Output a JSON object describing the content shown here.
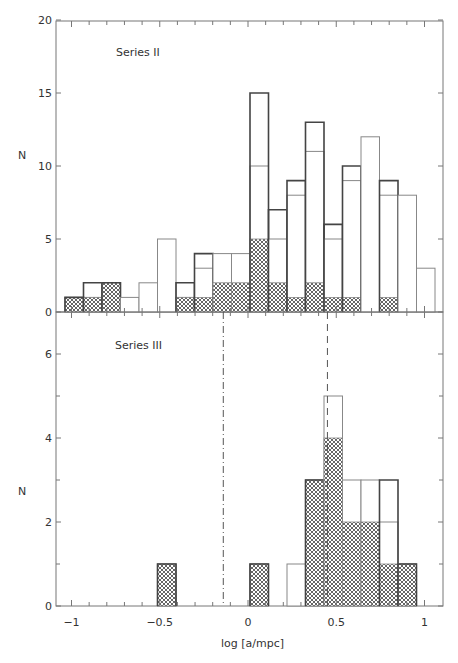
{
  "chart_data": [
    {
      "type": "bar",
      "title": "",
      "panel_label": "Series II",
      "xlabel": "",
      "ylabel": "N",
      "ylim": [
        0,
        20
      ],
      "yticks": [
        0,
        5,
        10,
        15,
        20
      ],
      "bin_width": 0.105,
      "bins_x_center": [
        -1.0,
        -0.9,
        -0.79,
        -0.69,
        -0.58,
        -0.48,
        -0.37,
        -0.27,
        -0.16,
        -0.06,
        0.06,
        0.16,
        0.27,
        0.37,
        0.48,
        0.58,
        0.69,
        0.79,
        0.9,
        1.0
      ],
      "series": [
        {
          "name": "total (outer outline)",
          "values": [
            1,
            2,
            2,
            1,
            2,
            5,
            2,
            4,
            4,
            4,
            15,
            7,
            9,
            13,
            6,
            10,
            12,
            9,
            8,
            3
          ]
        },
        {
          "name": "subset (inner line)",
          "values": [
            1,
            1,
            2,
            1,
            2,
            5,
            1,
            3,
            4,
            4,
            10,
            5,
            8,
            11,
            5,
            9,
            12,
            8,
            8,
            3
          ]
        },
        {
          "name": "hatched",
          "values": [
            1,
            1,
            2,
            0,
            0,
            0,
            1,
            1,
            2,
            2,
            5,
            2,
            1,
            2,
            1,
            1,
            0,
            1,
            0,
            0
          ]
        }
      ],
      "grid": false
    },
    {
      "type": "bar",
      "title": "",
      "panel_label": "Series III",
      "xlabel": "log [a/mpc]",
      "ylabel": "N",
      "ylim": [
        0,
        7
      ],
      "yticks": [
        0,
        2,
        4,
        6
      ],
      "xlim": [
        -1.05,
        1.1
      ],
      "xticks": [
        -1,
        -0.5,
        0,
        0.5,
        1
      ],
      "xtick_labels": [
        "−1",
        "−0.5",
        "0",
        "0.5",
        "1"
      ],
      "bin_width": 0.105,
      "bins_x_center": [
        -0.48,
        0.06,
        0.27,
        0.37,
        0.48,
        0.58,
        0.69,
        0.79,
        0.9
      ],
      "series": [
        {
          "name": "total (outer outline)",
          "values": [
            1,
            1,
            1,
            3,
            5,
            3,
            3,
            3,
            1
          ]
        },
        {
          "name": "subset (inner line)",
          "values": [
            1,
            1,
            1,
            3,
            5,
            3,
            3,
            2,
            1
          ]
        },
        {
          "name": "hatched",
          "values": [
            1,
            1,
            0,
            3,
            4,
            2,
            2,
            1,
            1
          ]
        }
      ],
      "vertical_lines": [
        {
          "x": -0.14,
          "style": "dash-dot"
        },
        {
          "x": 0.45,
          "style": "dashed"
        }
      ],
      "grid": false
    }
  ],
  "labels": {
    "top_ylabel": "N",
    "bottom_ylabel": "N",
    "top_series": "Series II",
    "bottom_series": "Series III",
    "xlabel": "log [a/mpc]",
    "top_yticks": [
      "0",
      "5",
      "10",
      "15",
      "20"
    ],
    "bottom_yticks": [
      "0",
      "2",
      "4",
      "6"
    ],
    "xticks": [
      "−1",
      "−0.5",
      "0",
      "0.5",
      "1"
    ]
  },
  "geometry": {
    "bin_px": 18.5,
    "first_bin_left_px": 65,
    "top": {
      "y0": 312,
      "px_per_unit": 14.6,
      "top_edge": 21
    },
    "bottom": {
      "y0": 606,
      "px_per_unit": 42.0,
      "top_edge": 312
    },
    "bottom_bin_indices": [
      5,
      10,
      12,
      13,
      14,
      15,
      16,
      17,
      18
    ],
    "axis_left": 56,
    "axis_right": 443,
    "x_zero_px": 248,
    "px_per_x_unit": 176.5
  },
  "colors": {
    "axis": "#777777",
    "bar_thick": "#444444",
    "bar_thin": "#888888",
    "hatch": "#555555"
  }
}
